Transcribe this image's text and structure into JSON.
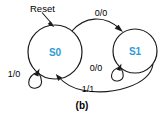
{
  "figure": {
    "kind": "finite-state-machine-diagram",
    "caption": "(b)",
    "background_color": "#ffffff",
    "line_color": "#1a1a1a",
    "state_text_color": "#2e9bd6"
  },
  "reset": {
    "label": "Reset",
    "target_state": "S0"
  },
  "states": [
    {
      "id": "S0",
      "label": "S0",
      "cx": 55,
      "cy": 52,
      "r": 27
    },
    {
      "id": "S1",
      "label": "S1",
      "cx": 135,
      "cy": 51,
      "r": 22
    }
  ],
  "transitions": [
    {
      "id": "s0-to-s1",
      "from": "S0",
      "to": "S1",
      "label": "0/0",
      "label_x": 101,
      "label_y": 16,
      "kind": "arc-top"
    },
    {
      "id": "s0-self",
      "from": "S0",
      "to": "S0",
      "label": "1/0",
      "label_x": 14,
      "label_y": 77,
      "kind": "self-loop"
    },
    {
      "id": "s1-self",
      "from": "S1",
      "to": "S1",
      "label": "0/0",
      "label_x": 96,
      "label_y": 71,
      "kind": "self-loop"
    },
    {
      "id": "s1-to-s0",
      "from": "S1",
      "to": "S0",
      "label": "1/1",
      "label_x": 88,
      "label_y": 92,
      "kind": "arc-bottom"
    }
  ]
}
